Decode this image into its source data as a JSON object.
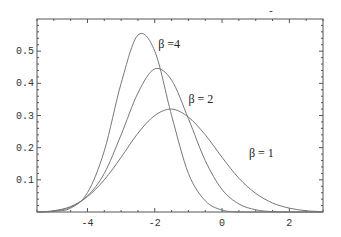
{
  "chart_data": {
    "type": "line",
    "title": "",
    "top_mark": "-",
    "xlabel": "",
    "ylabel": "",
    "xlim": [
      -5.5,
      3.0
    ],
    "ylim": [
      0,
      0.6
    ],
    "grid": false,
    "legend": "inline curve labels",
    "x_ticks": [
      -4,
      -2,
      0,
      2
    ],
    "x_tick_labels": [
      "-4",
      "-2",
      "0",
      "2"
    ],
    "y_ticks": [
      0.1,
      0.2,
      0.3,
      0.4,
      0.5
    ],
    "y_tick_labels": [
      "0.1",
      "0.2",
      "0.3",
      "0.4",
      "0.5"
    ],
    "x": [
      -5.5,
      -5.0,
      -4.5,
      -4.0,
      -3.5,
      -3.0,
      -2.5,
      -2.0,
      -1.5,
      -1.0,
      -0.5,
      0.0,
      0.5,
      1.0,
      1.5,
      2.0,
      2.5,
      3.0
    ],
    "series": [
      {
        "name": "β = 4",
        "values": [
          0.0,
          0.002,
          0.012,
          0.06,
          0.19,
          0.4,
          0.55,
          0.5,
          0.3,
          0.12,
          0.035,
          0.006,
          0.0,
          0.0,
          0.0,
          0.0,
          0.0,
          0.0
        ]
      },
      {
        "name": "β = 2",
        "values": [
          0.0,
          0.003,
          0.015,
          0.05,
          0.12,
          0.24,
          0.37,
          0.445,
          0.41,
          0.29,
          0.16,
          0.07,
          0.025,
          0.007,
          0.001,
          0.0,
          0.0,
          0.0
        ]
      },
      {
        "name": "β = 1",
        "values": [
          0.0,
          0.004,
          0.017,
          0.048,
          0.1,
          0.17,
          0.245,
          0.3,
          0.32,
          0.295,
          0.24,
          0.17,
          0.105,
          0.058,
          0.028,
          0.012,
          0.004,
          0.001
        ]
      }
    ],
    "annotations": [
      {
        "text": "β =4",
        "x": -1.9,
        "y": 0.51
      },
      {
        "text": "β = 2",
        "x": -1.0,
        "y": 0.34
      },
      {
        "text": "β = 1",
        "x": 0.8,
        "y": 0.17
      }
    ],
    "peaks": [
      {
        "series": "β = 4",
        "x": -2.35,
        "y": 0.556
      },
      {
        "series": "β = 2",
        "x": -1.88,
        "y": 0.447
      },
      {
        "series": "β = 1",
        "x": -1.35,
        "y": 0.319
      }
    ]
  }
}
